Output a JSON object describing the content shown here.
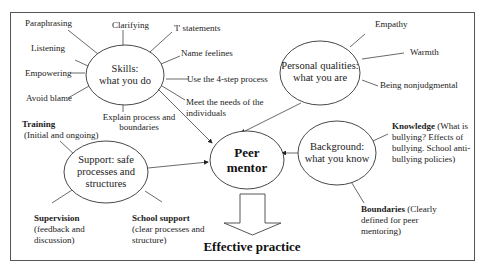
{
  "center": {
    "line1": "Peer",
    "line2": "mentor"
  },
  "outcome": "Effective practice",
  "skills": {
    "title_line1": "Skills:",
    "title_line2": "what you do",
    "items": [
      "Paraphrasing",
      "Clarifying",
      "'I' statements",
      "Name feelines",
      "Use the 4-step process",
      "Meet the needs of the",
      "individuals",
      "Explain process and",
      "boundaries",
      "Avoid blame",
      "Empowering",
      "Listening"
    ]
  },
  "personal": {
    "title_line1": "Personal qualities:",
    "title_line2": "what you are",
    "items": [
      "Empathy",
      "Warmth",
      "Being nonjudgmental"
    ]
  },
  "background": {
    "title_line1": "Background:",
    "title_line2": "what you know",
    "knowledge_bold": "Knowledge",
    "knowledge_rest1": " (What is",
    "knowledge_line2": "bullying?  Effects of",
    "knowledge_line3": "bullying.  School anti-",
    "knowledge_line4": "bullying policies)",
    "boundaries_bold": "Boundaries",
    "boundaries_rest1": " (Clearly",
    "boundaries_line2": "defined for peer",
    "boundaries_line3": "mentoring)"
  },
  "support": {
    "title_line1": "Support: safe",
    "title_line2": "processes and",
    "title_line3": "structures",
    "training_bold": "Training",
    "training_line2": "(Initial and ongoing)",
    "supervision_bold": "Supervision",
    "supervision_line2": "(feedback and",
    "supervision_line3": "discussion)",
    "school_bold": "School support",
    "school_line2": "(clear processes and",
    "school_line3": "structure)"
  }
}
